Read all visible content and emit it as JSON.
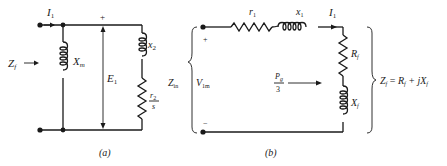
{
  "figure_a": {
    "caption": "(a)",
    "current_label": "I",
    "current_sub": "1",
    "impedance_label": "Z",
    "impedance_sub": "f",
    "magnetizing_label": "X",
    "magnetizing_sub": "m",
    "voltage_label": "E",
    "voltage_sub": "1",
    "plus": "+",
    "rotor_reactance_label": "x",
    "rotor_reactance_sub": "2",
    "rotor_resistance_num": "r",
    "rotor_resistance_num_sub": "2",
    "rotor_resistance_den": "s"
  },
  "figure_b": {
    "caption": "(b)",
    "input_impedance_label": "Z",
    "input_impedance_sub": "in",
    "voltage_label": "V",
    "voltage_sub": "1m",
    "plus": "+",
    "minus": "−",
    "stator_resistance_label": "r",
    "stator_resistance_sub": "1",
    "stator_reactance_label": "x",
    "stator_reactance_sub": "1",
    "current_label": "I",
    "current_sub": "1",
    "Rf_label": "R",
    "Rf_sub": "f",
    "Xf_label": "X",
    "Xf_sub": "f",
    "power_num": "P",
    "power_num_sub": "g",
    "power_den": "3",
    "equation": {
      "lhs": "Z",
      "lhs_sub": "f",
      "eq": " = ",
      "r": "R",
      "r_sub": "f",
      "plus": " + j",
      "x": "X",
      "x_sub": "f"
    }
  },
  "colors": {
    "ink": "#1a1a1a",
    "background": "#ffffff"
  }
}
